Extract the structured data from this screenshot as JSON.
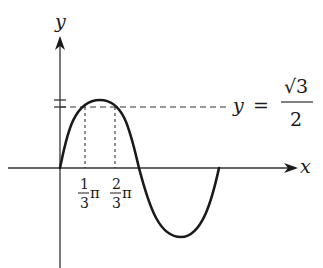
{
  "diagram": {
    "type": "function-graph",
    "function": "y = sin(x) (one period)",
    "axes": {
      "x_label": "x",
      "y_label": "y"
    },
    "horizontal_line": {
      "label_lhs": "y",
      "label_eq": "=",
      "label_numerator": "√3",
      "label_denominator": "2",
      "value": "√3/2"
    },
    "x_markers": [
      {
        "numerator": "1",
        "denominator": "3",
        "symbol": "π",
        "value": "π/3"
      },
      {
        "numerator": "2",
        "denominator": "3",
        "symbol": "π",
        "value": "2π/3"
      }
    ],
    "colors": {
      "curve": "#1a1a1a",
      "axes": "#333333",
      "dashed": "#333333"
    }
  }
}
